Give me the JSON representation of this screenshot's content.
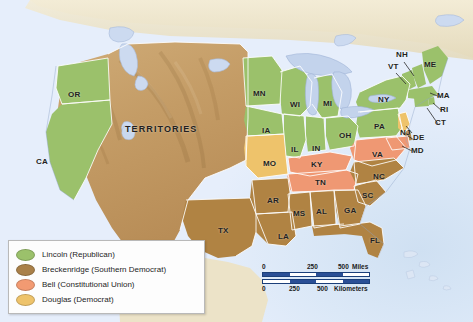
{
  "map": {
    "title": "Presidential Election of 1860",
    "territories_label": "TERRITORIES",
    "colors": {
      "lincoln_green": "#9bc16b",
      "breckenridge_brown": "#b08343",
      "bell_salmon": "#ef9873",
      "douglas_gold": "#eec56a",
      "territory_tan": "#c09a64",
      "foreign_cream": "#ece3c8",
      "ocean_blue": "#d7e5f6",
      "lake_blue": "#c3d3ec",
      "border_white": "#ffffff",
      "label_black": "#231f20"
    },
    "states": [
      {
        "code": "OR",
        "party": "lincoln",
        "x": 68,
        "y": 90
      },
      {
        "code": "CA",
        "party": "lincoln",
        "x": 36,
        "y": 157
      },
      {
        "code": "MN",
        "party": "lincoln",
        "x": 253,
        "y": 89
      },
      {
        "code": "WI",
        "party": "lincoln",
        "x": 290,
        "y": 100
      },
      {
        "code": "MI",
        "party": "lincoln",
        "x": 323,
        "y": 99
      },
      {
        "code": "IA",
        "party": "lincoln",
        "x": 262,
        "y": 126
      },
      {
        "code": "IL",
        "party": "lincoln",
        "x": 295,
        "y": 145
      },
      {
        "code": "IN",
        "party": "lincoln",
        "x": 318,
        "y": 144
      },
      {
        "code": "OH",
        "party": "lincoln",
        "x": 345,
        "y": 134
      },
      {
        "code": "PA",
        "party": "lincoln",
        "x": 379,
        "y": 124
      },
      {
        "code": "NY",
        "party": "lincoln",
        "x": 388,
        "y": 101
      },
      {
        "code": "NH",
        "party": "lincoln",
        "x": 399,
        "y": 55
      },
      {
        "code": "VT",
        "party": "lincoln",
        "x": 391,
        "y": 66
      },
      {
        "code": "ME",
        "party": "lincoln",
        "x": 428,
        "y": 64
      },
      {
        "code": "MA",
        "party": "lincoln",
        "x": 440,
        "y": 92
      },
      {
        "code": "RI",
        "party": "lincoln",
        "x": 444,
        "y": 109
      },
      {
        "code": "CT",
        "party": "lincoln",
        "x": 440,
        "y": 121
      },
      {
        "code": "NJ",
        "party": "douglas",
        "x": 404,
        "y": 128
      },
      {
        "code": "MO",
        "party": "douglas",
        "x": 268,
        "y": 160
      },
      {
        "code": "DE",
        "party": "breckenridge",
        "x": 417,
        "y": 136
      },
      {
        "code": "MD",
        "party": "bell",
        "x": 415,
        "y": 148
      },
      {
        "code": "VA",
        "party": "bell",
        "x": 377,
        "y": 155
      },
      {
        "code": "KY",
        "party": "bell",
        "x": 316,
        "y": 166
      },
      {
        "code": "TN",
        "party": "bell",
        "x": 320,
        "y": 185
      },
      {
        "code": "NC",
        "party": "breckenridge",
        "x": 378,
        "y": 178
      },
      {
        "code": "SC",
        "party": "breckenridge",
        "x": 366,
        "y": 196
      },
      {
        "code": "GA",
        "party": "breckenridge",
        "x": 348,
        "y": 211
      },
      {
        "code": "AL",
        "party": "breckenridge",
        "x": 320,
        "y": 211
      },
      {
        "code": "MS",
        "party": "breckenridge",
        "x": 297,
        "y": 212
      },
      {
        "code": "AR",
        "party": "breckenridge",
        "x": 272,
        "y": 200
      },
      {
        "code": "LA",
        "party": "breckenridge",
        "x": 283,
        "y": 236
      },
      {
        "code": "FL",
        "party": "breckenridge",
        "x": 375,
        "y": 238
      },
      {
        "code": "TX",
        "party": "breckenridge",
        "x": 223,
        "y": 229
      }
    ]
  },
  "legend": {
    "items": [
      {
        "label": "Lincoln (Republican)",
        "color": "#9bc16b",
        "party": "lincoln"
      },
      {
        "label": "Breckenridge (Southern Democrat)",
        "color": "#a98049",
        "party": "breckenridge"
      },
      {
        "label": "Bell (Constitutional Union)",
        "color": "#f29a72",
        "party": "bell"
      },
      {
        "label": "Douglas (Democrat)",
        "color": "#eec36b",
        "party": "douglas"
      }
    ]
  },
  "scale": {
    "miles": {
      "unit": "Miles",
      "ticks": [
        "0",
        "250",
        "500"
      ]
    },
    "kilometers": {
      "unit": "Kilometers",
      "ticks": [
        "0",
        "250",
        "500"
      ]
    }
  }
}
